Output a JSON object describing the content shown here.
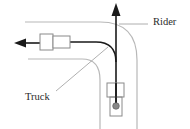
{
  "diagram": {
    "labels": {
      "rider": "Rider",
      "truck": "Truck"
    },
    "colors": {
      "road_edge": "#b8b8b8",
      "path": "#1a1a1a",
      "vehicle_outline": "#8a8a8a",
      "leader_line": "#9a9a9a",
      "rider_dot": "#888888"
    }
  }
}
